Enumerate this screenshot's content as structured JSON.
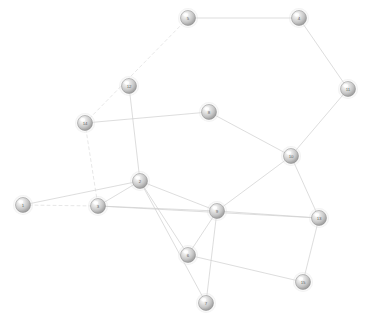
{
  "graph": {
    "title": "",
    "type": "node-link-network",
    "width": 367,
    "height": 319,
    "background_color": "#ffffff",
    "node_style": {
      "radius": 7.5,
      "fill_highlight": "#ffffff",
      "fill_mid": "#d8d8d8",
      "fill_edge": "#9a9a9a",
      "stroke": "#8f8f8f",
      "label_color": "#5e5e5e"
    },
    "edge_style": {
      "solid_color": "#cfcfcf",
      "dashed_color": "#dcdcdc",
      "width": 0.7,
      "dash_pattern": "3,3"
    },
    "nodes": [
      {
        "id": "1",
        "label": "1",
        "x": 23,
        "y": 205
      },
      {
        "id": "2",
        "label": "2",
        "x": 140,
        "y": 181
      },
      {
        "id": "3",
        "label": "3",
        "x": 98,
        "y": 206
      },
      {
        "id": "4",
        "label": "4",
        "x": 299,
        "y": 18
      },
      {
        "id": "5",
        "label": "5",
        "x": 188,
        "y": 18
      },
      {
        "id": "6",
        "label": "6",
        "x": 188,
        "y": 255
      },
      {
        "id": "7",
        "label": "7",
        "x": 206,
        "y": 303
      },
      {
        "id": "8",
        "label": "8",
        "x": 209,
        "y": 112
      },
      {
        "id": "9",
        "label": "9",
        "x": 217,
        "y": 211
      },
      {
        "id": "10",
        "label": "10",
        "x": 291,
        "y": 156
      },
      {
        "id": "11",
        "label": "11",
        "x": 348,
        "y": 89
      },
      {
        "id": "12",
        "label": "12",
        "x": 129,
        "y": 86
      },
      {
        "id": "13",
        "label": "13",
        "x": 319,
        "y": 218
      },
      {
        "id": "14",
        "label": "14",
        "x": 85,
        "y": 123
      },
      {
        "id": "15",
        "label": "15",
        "x": 303,
        "y": 282
      }
    ],
    "edges": [
      {
        "source": "5",
        "target": "4",
        "style": "solid"
      },
      {
        "source": "4",
        "target": "11",
        "style": "solid"
      },
      {
        "source": "11",
        "target": "10",
        "style": "solid"
      },
      {
        "source": "10",
        "target": "8",
        "style": "solid"
      },
      {
        "source": "10",
        "target": "9",
        "style": "solid"
      },
      {
        "source": "10",
        "target": "13",
        "style": "solid"
      },
      {
        "source": "8",
        "target": "14",
        "style": "solid"
      },
      {
        "source": "12",
        "target": "2",
        "style": "solid"
      },
      {
        "source": "5",
        "target": "14",
        "style": "dashed"
      },
      {
        "source": "14",
        "target": "3",
        "style": "dashed"
      },
      {
        "source": "2",
        "target": "1",
        "style": "solid"
      },
      {
        "source": "2",
        "target": "3",
        "style": "solid"
      },
      {
        "source": "2",
        "target": "9",
        "style": "solid"
      },
      {
        "source": "2",
        "target": "6",
        "style": "solid"
      },
      {
        "source": "2",
        "target": "7",
        "style": "solid"
      },
      {
        "source": "3",
        "target": "9",
        "style": "solid"
      },
      {
        "source": "3",
        "target": "13",
        "style": "solid"
      },
      {
        "source": "9",
        "target": "6",
        "style": "solid"
      },
      {
        "source": "9",
        "target": "13",
        "style": "solid"
      },
      {
        "source": "9",
        "target": "7",
        "style": "solid"
      },
      {
        "source": "6",
        "target": "15",
        "style": "solid"
      },
      {
        "source": "13",
        "target": "15",
        "style": "solid"
      },
      {
        "source": "1",
        "target": "3",
        "style": "dashed"
      }
    ]
  }
}
